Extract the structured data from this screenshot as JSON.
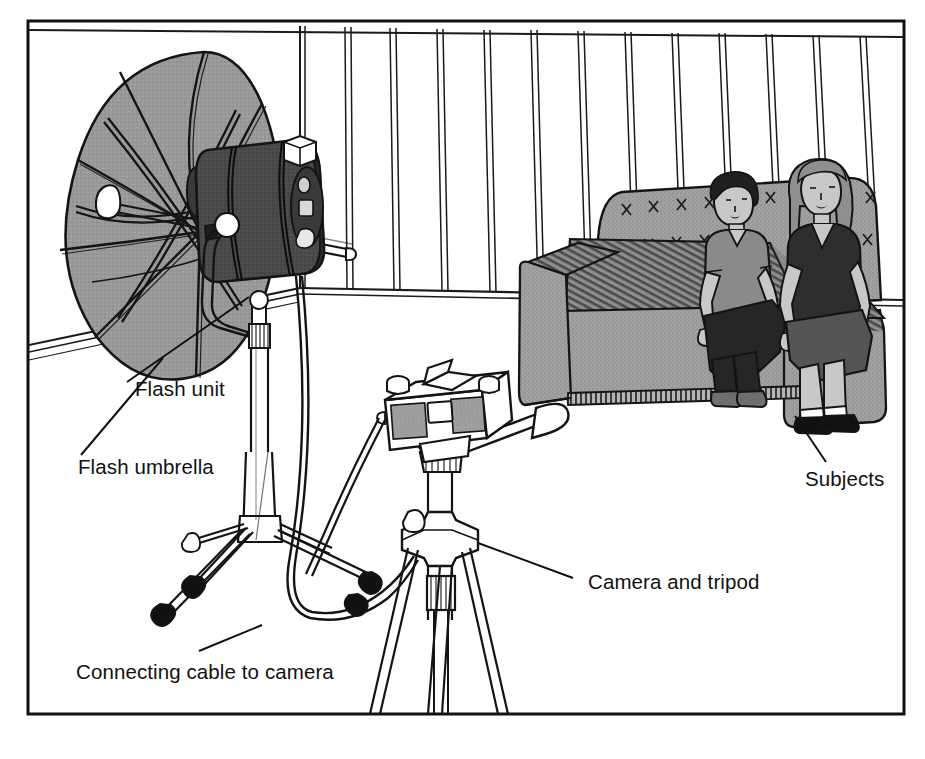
{
  "figure": {
    "type": "line-illustration",
    "frame": {
      "x": 28,
      "y": 21,
      "width": 876,
      "height": 693,
      "stroke": "#111111",
      "stroke_width": 3
    },
    "background": "#ffffff"
  },
  "palette": {
    "ink": "#111111",
    "line": "#1a1a1a",
    "white": "#ffffff",
    "umbrella_gray": "#9a9a9a",
    "umbrella_gray_dark": "#8a8a8a",
    "flash_body_dark": "#3a3a3a",
    "flash_body_mid": "#4d4d4d",
    "sofa_gray": "#a0a0a0",
    "sofa_shadow": "#6e6e6e",
    "sofa_dark": "#595959",
    "skin_gray": "#c8c8c8",
    "shirt_mid_gray": "#8a8a8a",
    "shirt_dark": "#2e2e2e",
    "trouser_dark": "#262626",
    "hair_dark": "#1f1f1f",
    "hair_mid": "#8f8f8f",
    "foot_black": "#111111",
    "floor": "#ffffff",
    "wall": "#ffffff"
  },
  "labels": [
    {
      "id": "flash-unit",
      "text": "Flash unit",
      "text_x": 135,
      "text_y": 396,
      "leader": {
        "x1": 249,
        "y1": 297,
        "x2": 127,
        "y2": 382
      }
    },
    {
      "id": "flash-umbrella",
      "text": "Flash umbrella",
      "text_x": 78,
      "text_y": 474,
      "leader": {
        "x1": 163,
        "y1": 358,
        "x2": 81,
        "y2": 455
      }
    },
    {
      "id": "connecting-cable",
      "text": "Connecting cable to camera",
      "text_x": 76,
      "text_y": 679,
      "leader": {
        "x1": 262,
        "y1": 625,
        "x2": 199,
        "y2": 651
      }
    },
    {
      "id": "camera-and-tripod",
      "text": "Camera and tripod",
      "text_x": 588,
      "text_y": 589,
      "leader": {
        "x1": 478,
        "y1": 543,
        "x2": 573,
        "y2": 578
      }
    },
    {
      "id": "subjects",
      "text": "Subjects",
      "text_x": 805,
      "text_y": 486,
      "leader": {
        "x1": 795,
        "y1": 416,
        "x2": 826,
        "y2": 462
      }
    }
  ],
  "scene": {
    "room": {
      "name": "studio room with panelled wall",
      "wall_panel_count": 14,
      "baseboard": true,
      "corner_x": 300
    },
    "objects": [
      {
        "name": "flash-umbrella",
        "description": "Large parabolic reflective umbrella, gray canopy with black ribs, tilted toward subjects"
      },
      {
        "name": "flash-unit",
        "description": "Dark cylindrical studio flash head mounted on yoke bracket"
      },
      {
        "name": "light-stand",
        "description": "Chrome telescoping tripod light stand with black rubber feet"
      },
      {
        "name": "sync-cable",
        "description": "Thin cable looping from flash across floor to camera"
      },
      {
        "name": "camera",
        "description": "35mm SLR camera on pan-tilt tripod head with handle"
      },
      {
        "name": "camera-tripod",
        "description": "Three-legged camera tripod with centre column and leg brace collar"
      },
      {
        "name": "sofa",
        "description": "Tufted gray two-seat sofa with striped arm and seat shading"
      },
      {
        "name": "subject-left",
        "description": "Seated person in mid-gray short-sleeve shirt and dark trousers"
      },
      {
        "name": "subject-right",
        "description": "Seated person with long hair, dark top and lighter skirt"
      }
    ]
  }
}
